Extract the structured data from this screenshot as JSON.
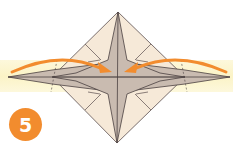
{
  "diagram": {
    "step_number": "5",
    "colors": {
      "background": "#ffffff",
      "highlight_band": "#fbf5cf",
      "paper_light": "#f6e9d8",
      "paper_shaded": "#c9bbb0",
      "crease_line": "#4a4040",
      "arrow": "#f28c2e",
      "badge": "#f28c2e"
    },
    "arrows": [
      {
        "name": "left-fold-arrow",
        "direction": "left-to-center"
      },
      {
        "name": "right-fold-arrow",
        "direction": "right-to-center"
      }
    ]
  }
}
